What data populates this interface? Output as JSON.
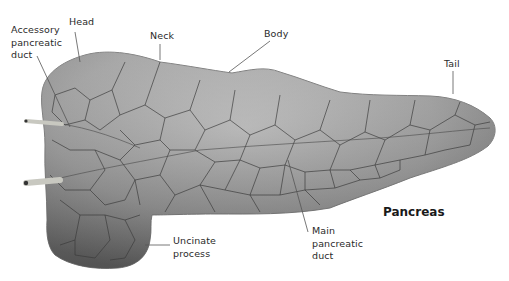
{
  "title": "Pancreas",
  "labels": {
    "accessory_duct": "Accessory\npancreatic\nduct",
    "head": "Head",
    "neck": "Neck",
    "body": "Body",
    "tail": "Tail",
    "uncinate": "Uncinate\nprocess",
    "main_duct": "Main\npancreatic\nduct"
  },
  "colors": {
    "organ_fill": "#9a9a9a",
    "organ_light": "#bdbdbd",
    "organ_dark": "#6e6e6e",
    "lobule_lines": "#3a3a3a",
    "leader_lines": "#555555",
    "duct_stub": "#c8c8c0"
  }
}
